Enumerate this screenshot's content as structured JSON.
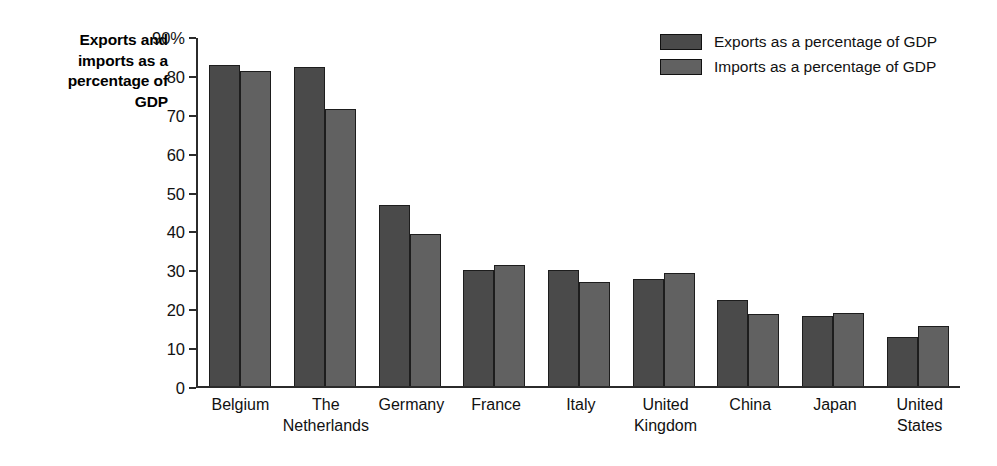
{
  "chart_data": {
    "type": "bar",
    "title": "",
    "axis_title": [
      "Exports and",
      "imports as a",
      "percentage of",
      "GDP"
    ],
    "categories": [
      [
        "Belgium"
      ],
      [
        "The",
        "Netherlands"
      ],
      [
        "Germany"
      ],
      [
        "France"
      ],
      [
        "Italy"
      ],
      [
        "United",
        "Kingdom"
      ],
      [
        "China"
      ],
      [
        "Japan"
      ],
      [
        "United",
        "States"
      ]
    ],
    "series": [
      {
        "name": "Exports as a percentage of GDP",
        "color": "#4a4a4a",
        "values": [
          83.0,
          82.5,
          46.8,
          30.0,
          30.1,
          27.6,
          22.2,
          18.0,
          12.7
        ]
      },
      {
        "name": "Imports as a percentage of GDP",
        "color": "#616161",
        "values": [
          81.4,
          71.6,
          39.2,
          31.4,
          27.0,
          29.3,
          18.6,
          19.0,
          15.5
        ]
      }
    ],
    "xlabel": "",
    "ylabel": "Exports and imports as a percentage of GDP",
    "ylim": [
      0,
      90
    ],
    "yticks": [
      0,
      10,
      20,
      30,
      40,
      50,
      60,
      70,
      80,
      90
    ],
    "ytick_labels": [
      "0",
      "10",
      "20",
      "30",
      "40",
      "50",
      "60",
      "70",
      "80",
      "90%"
    ],
    "grid": false,
    "legend_position": "top-right"
  }
}
